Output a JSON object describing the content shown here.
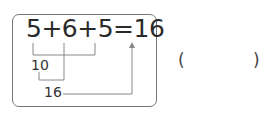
{
  "problem": {
    "equation": "5+6+5=16",
    "partial_sum_1": "10",
    "partial_sum_2": "16"
  },
  "answer": {
    "open_paren": "(",
    "value": "",
    "close_paren": ")"
  }
}
